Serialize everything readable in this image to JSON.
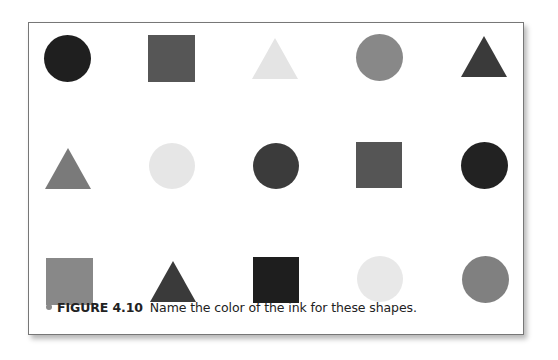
{
  "figure": {
    "caption_label": "FIGURE 4.10",
    "caption_text": "Name the color of the ink for these shapes.",
    "bullet_color": "#8a8a8a",
    "border_color": "#777777"
  },
  "shapes": [
    {
      "row": 1,
      "col": 1,
      "type": "circle",
      "color": "#1f1f1f",
      "cx": 67,
      "cy": 58,
      "size": 47
    },
    {
      "row": 1,
      "col": 2,
      "type": "square",
      "color": "#565656",
      "cx": 171,
      "cy": 58,
      "size": 47
    },
    {
      "row": 1,
      "col": 3,
      "type": "triangle",
      "color": "#e4e4e4",
      "cx": 275,
      "cy": 58,
      "size": 46
    },
    {
      "row": 1,
      "col": 4,
      "type": "circle",
      "color": "#888888",
      "cx": 379,
      "cy": 57,
      "size": 47
    },
    {
      "row": 1,
      "col": 5,
      "type": "triangle",
      "color": "#3a3a3a",
      "cx": 484,
      "cy": 56,
      "size": 46
    },
    {
      "row": 2,
      "col": 1,
      "type": "triangle",
      "color": "#7a7a7a",
      "cx": 68,
      "cy": 168,
      "size": 46
    },
    {
      "row": 2,
      "col": 2,
      "type": "circle",
      "color": "#e6e6e6",
      "cx": 172,
      "cy": 166,
      "size": 46
    },
    {
      "row": 2,
      "col": 3,
      "type": "circle",
      "color": "#3b3b3b",
      "cx": 276,
      "cy": 166,
      "size": 46
    },
    {
      "row": 2,
      "col": 4,
      "type": "square",
      "color": "#555555",
      "cx": 379,
      "cy": 165,
      "size": 46
    },
    {
      "row": 2,
      "col": 5,
      "type": "circle",
      "color": "#222222",
      "cx": 484,
      "cy": 165,
      "size": 47
    },
    {
      "row": 3,
      "col": 1,
      "type": "square",
      "color": "#888888",
      "cx": 69,
      "cy": 281,
      "size": 47
    },
    {
      "row": 3,
      "col": 2,
      "type": "triangle",
      "color": "#3a3a3a",
      "cx": 173,
      "cy": 281,
      "size": 46
    },
    {
      "row": 3,
      "col": 3,
      "type": "square",
      "color": "#1e1e1e",
      "cx": 276,
      "cy": 280,
      "size": 46
    },
    {
      "row": 3,
      "col": 4,
      "type": "circle",
      "color": "#e8e8e8",
      "cx": 380,
      "cy": 279,
      "size": 46
    },
    {
      "row": 3,
      "col": 5,
      "type": "circle",
      "color": "#808080",
      "cx": 485,
      "cy": 279,
      "size": 47
    }
  ]
}
